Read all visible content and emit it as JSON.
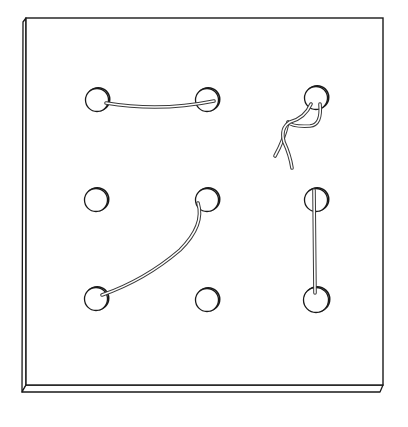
{
  "figure": {
    "title": "Lacing pegboard with 3x3 holes and strings",
    "colors": {
      "background": "#ffffff",
      "board_face": "#ffffff",
      "outline": "#1a1a1a",
      "string_outline": "#3a3a3a",
      "string_fill": "#ffffff"
    },
    "board": {
      "face": {
        "x": 26,
        "y": 18,
        "width": 357,
        "height": 367
      },
      "left_side_depth": 4,
      "bottom_side_depth": 7
    },
    "holes": [
      {
        "id": "r1c1",
        "cx": 97,
        "cy": 100,
        "r": 11.5
      },
      {
        "id": "r1c2",
        "cx": 207,
        "cy": 100,
        "r": 11.5
      },
      {
        "id": "r1c3",
        "cx": 316,
        "cy": 98,
        "r": 11.5
      },
      {
        "id": "r2c1",
        "cx": 96,
        "cy": 200,
        "r": 11.5
      },
      {
        "id": "r2c2",
        "cx": 207,
        "cy": 200,
        "r": 11.5
      },
      {
        "id": "r2c3",
        "cx": 316,
        "cy": 200,
        "r": 11.5
      },
      {
        "id": "r3c1",
        "cx": 96,
        "cy": 299,
        "r": 11.5
      },
      {
        "id": "r3c2",
        "cx": 207,
        "cy": 300,
        "r": 11.5
      },
      {
        "id": "r3c3",
        "cx": 316,
        "cy": 300,
        "r": 12.5
      }
    ],
    "strings": [
      {
        "id": "string-r1c1-r1c2",
        "from": "r1c1",
        "to": "r1c2",
        "path": "M106,103 Q160,112 214,101"
      },
      {
        "id": "string-r2c2-r3c1",
        "from": "r2c2",
        "to": "r3c1",
        "path": "M198,203 Q205,225 180,250 Q145,280 102,295"
      },
      {
        "id": "string-r2c3-r3c3",
        "from": "r2c3",
        "to": "r3c3",
        "path": "M314,190 L315,293"
      },
      {
        "id": "string-r1c3-tangle-a",
        "from": "r1c3",
        "to": "loose-end",
        "path": "M320,104 Q322,125 310,126 Q292,127 288,122 Q284,140 275,156"
      },
      {
        "id": "string-r1c3-tangle-b",
        "from": "r1c3",
        "to": "loose-end",
        "path": "M311,104 Q305,118 290,122 Q280,128 284,142 Q290,155 292,168"
      }
    ]
  }
}
